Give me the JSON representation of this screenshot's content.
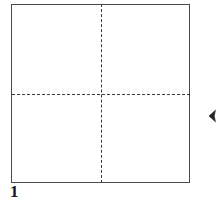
{
  "diagram": {
    "step_label": "1",
    "background_color": "#ffffff",
    "paper": {
      "name": "square-sheet",
      "outline_color": "#4a4a4a",
      "fill_color": "#ffffff",
      "shape": "square"
    },
    "creases": [
      {
        "name": "vertical-center-crease",
        "orientation": "vertical",
        "style": "dashed",
        "color": "#3b3b3b"
      },
      {
        "name": "horizontal-center-crease",
        "orientation": "horizontal",
        "style": "dashed",
        "color": "#3b3b3b"
      }
    ],
    "arrow": {
      "name": "left-pointing-arrowhead",
      "direction": "left",
      "color": "#222222"
    }
  }
}
